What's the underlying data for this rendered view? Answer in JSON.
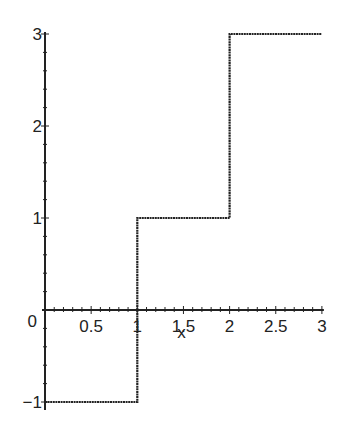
{
  "chart_data": {
    "type": "line",
    "subtype": "step",
    "title": "",
    "xlabel": "x",
    "ylabel": "",
    "xlim": [
      0,
      3
    ],
    "ylim": [
      -1,
      3
    ],
    "grid": false,
    "legend": null,
    "x_ticks": [
      {
        "value": 0.5,
        "label": "0.5"
      },
      {
        "value": 1,
        "label": "1"
      },
      {
        "value": 1.5,
        "label": "1.5"
      },
      {
        "value": 2,
        "label": "2"
      },
      {
        "value": 2.5,
        "label": "2.5"
      },
      {
        "value": 3,
        "label": "3"
      }
    ],
    "y_ticks": [
      {
        "value": -1,
        "label": "-1"
      },
      {
        "value": 1,
        "label": "1"
      },
      {
        "value": 2,
        "label": "2"
      },
      {
        "value": 3,
        "label": "3"
      }
    ],
    "origin_label": "0",
    "series": [
      {
        "name": "step function",
        "color": "#222222",
        "points": [
          [
            0,
            -1
          ],
          [
            1,
            -1
          ],
          [
            1,
            1
          ],
          [
            2,
            1
          ],
          [
            2,
            3
          ],
          [
            3,
            3
          ]
        ]
      }
    ]
  },
  "colors": {
    "axis": "#222222",
    "line": "#222222",
    "background": "#ffffff"
  }
}
